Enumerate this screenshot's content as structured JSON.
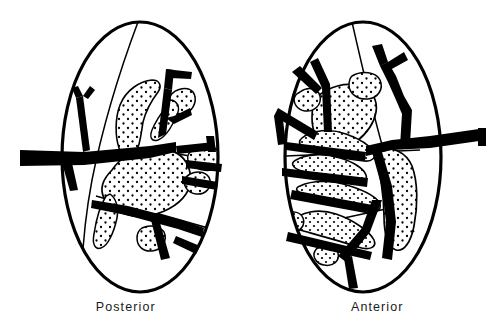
{
  "figure": {
    "type": "anatomical-line-drawing",
    "background_color": "#ffffff",
    "ink_color": "#000000",
    "outline_stroke_color": "#000000",
    "vessel_fill_color": "#000000",
    "stipple_dot_color": "#000000",
    "panels": [
      {
        "id": "posterior",
        "label": "Posterior",
        "view": "posterior",
        "center_x": 140,
        "center_y": 157,
        "radius_x": 78,
        "radius_y": 135,
        "hilum_side": "left",
        "artery_entry_x": 20,
        "artery_entry_y": 157
      },
      {
        "id": "anterior",
        "label": "Anterior",
        "view": "anterior",
        "center_x": 363,
        "center_y": 157,
        "radius_x": 78,
        "radius_y": 135,
        "hilum_side": "right",
        "artery_entry_x": 486,
        "artery_entry_y": 136
      }
    ]
  },
  "captions": {
    "left_label": "Posterior",
    "right_label": "Anterior"
  },
  "legend_semantics": {
    "solid_black_branches": "renal artery and segmental branches",
    "stippled_finger_shapes": "renal calyces and pelvis",
    "thin_lines_inside_outline": "renal segment boundary lines",
    "heavy_oval": "kidney capsule outline"
  }
}
